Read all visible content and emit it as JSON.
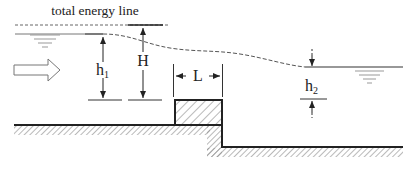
{
  "diagram": {
    "labels": {
      "energy_line": "total energy line",
      "h1": "h",
      "h1_sub": "1",
      "H": "H",
      "L": "L",
      "h2": "h",
      "h2_sub": "2"
    },
    "elements": [
      "total-energy-line",
      "upstream-water-surface",
      "downstream-water-surface",
      "flow-direction-arrow",
      "weir-block",
      "upstream-channel-bed",
      "downstream-channel-bed",
      "h1-dimension",
      "H-dimension",
      "L-dimension",
      "h2-dimension"
    ],
    "colors": {
      "line": "#222222",
      "dashed": "#555555",
      "hatch": "#999999",
      "water_symbol": "#888888"
    }
  }
}
